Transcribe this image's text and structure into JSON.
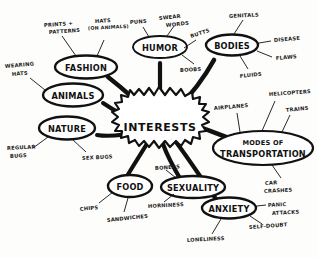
{
  "diagram": {
    "type": "hand-drawn-mind-map",
    "title": "INTERESTS",
    "style": {
      "ink_color": "#111111",
      "paper_color": "#fdfdfb"
    },
    "center": {
      "label": "INTERESTS",
      "shape": "starburst"
    },
    "nodes": [
      {
        "id": "fashion",
        "label": "FASHION",
        "shape": "ellipse",
        "leaves": [
          "PRINTS + PATTERNS",
          "HATS (ON ANIMALS)"
        ]
      },
      {
        "id": "animals",
        "label": "ANIMALS",
        "shape": "ellipse",
        "leaves": [
          "WEARING HATS"
        ]
      },
      {
        "id": "nature",
        "label": "NATURE",
        "shape": "ellipse",
        "leaves": [
          "REGULAR BUGS",
          "SEX BUGS"
        ]
      },
      {
        "id": "humor",
        "label": "HUMOR",
        "shape": "ellipse",
        "leaves": [
          "PUNS",
          "SWEAR WORDS",
          "BUTTS",
          "BOOBS"
        ]
      },
      {
        "id": "bodies",
        "label": "BODIES",
        "shape": "ellipse",
        "leaves": [
          "GENITALS",
          "DISEASE",
          "FLAWS",
          "FLUIDS"
        ]
      },
      {
        "id": "transportation",
        "label_line1": "MODES OF",
        "label_line2": "TRANSPORTATION",
        "shape": "ellipse",
        "leaves": [
          "AIRPLANES",
          "HELICOPTERS",
          "TRAINS",
          "CAR CRASHES"
        ]
      },
      {
        "id": "food",
        "label": "FOOD",
        "shape": "ellipse",
        "leaves": [
          "CHIPS",
          "SANDWICHES"
        ]
      },
      {
        "id": "sexuality",
        "label": "SEXUALITY",
        "shape": "ellipse",
        "leaves": [
          "BONERS",
          "HORNINESS"
        ]
      },
      {
        "id": "anxiety",
        "label": "ANXIETY",
        "shape": "ellipse",
        "leaves": [
          "PANIC ATTACKS",
          "SELF-DOUBT",
          "LONELINESS"
        ]
      }
    ],
    "leaf_labels": {
      "prints_patterns_l1": "PRINTS +",
      "prints_patterns_l2": "PATTERNS",
      "hats_on_animals_l1": "HATS",
      "hats_on_animals_l2": "(ON ANIMALS)",
      "wearing_hats_l1": "WEARING",
      "wearing_hats_l2": "HATS",
      "regular_bugs_l1": "REGULAR",
      "regular_bugs_l2": "BUGS",
      "sex_bugs": "SEX BUGS",
      "puns": "PUNS",
      "swear_words_l1": "SWEAR",
      "swear_words_l2": "WORDS",
      "butts": "BUTTS",
      "boobs": "BOOBS",
      "genitals": "GENITALS",
      "disease": "DISEASE",
      "flaws": "FLAWS",
      "fluids": "FLUIDS",
      "airplanes": "AIRPLANES",
      "helicopters": "HELICOPTERS",
      "trains": "TRAINS",
      "car_crashes_l1": "CAR",
      "car_crashes_l2": "CRASHES",
      "chips": "CHIPS",
      "sandwiches": "SANDWICHES",
      "boners": "BONERS",
      "horniness": "HORNINESS",
      "panic_attacks_l1": "PANIC",
      "panic_attacks_l2": "ATTACKS",
      "self_doubt": "SELF-DOUBT",
      "loneliness": "LONELINESS"
    }
  }
}
